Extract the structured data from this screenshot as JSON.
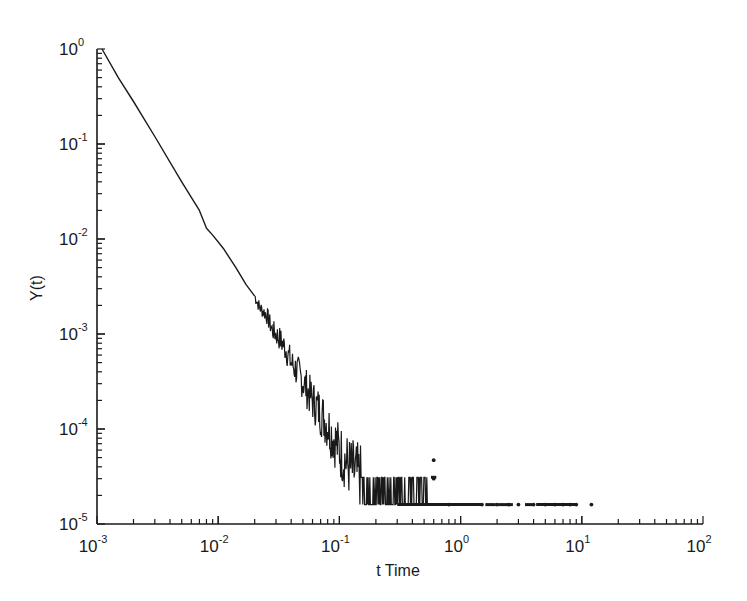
{
  "chart_data": {
    "type": "line",
    "title": "",
    "xlabel": "t Time",
    "ylabel": "Y(t)",
    "xscale": "log",
    "yscale": "log",
    "xlim": [
      0.001,
      100
    ],
    "ylim": [
      1e-05,
      1
    ],
    "grid": false,
    "legend": null,
    "x_tick_labels": [
      {
        "base": "10",
        "exp": "-3",
        "value": 0.001
      },
      {
        "base": "10",
        "exp": "-2",
        "value": 0.01
      },
      {
        "base": "10",
        "exp": "-1",
        "value": 0.1
      },
      {
        "base": "10",
        "exp": "0",
        "value": 1
      },
      {
        "base": "10",
        "exp": "1",
        "value": 10
      },
      {
        "base": "10",
        "exp": "2",
        "value": 100
      }
    ],
    "y_tick_labels": [
      {
        "base": "10",
        "exp": "0",
        "value": 1
      },
      {
        "base": "10",
        "exp": "-1",
        "value": 0.1
      },
      {
        "base": "10",
        "exp": "-2",
        "value": 0.01
      },
      {
        "base": "10",
        "exp": "-3",
        "value": 0.001
      },
      {
        "base": "10",
        "exp": "-4",
        "value": 0.0001
      },
      {
        "base": "10",
        "exp": "-5",
        "value": 1e-05
      }
    ],
    "series": [
      {
        "name": "Y(t)",
        "style": "line",
        "description": "Power-law decay from ~1 at t=1.1e-3, roughly straight on log-log, becoming noisy after t~0.02 and saturating at a floor of ~1.6e-5 for t > ~0.3",
        "points": [
          [
            0.0011,
            1.0
          ],
          [
            0.0015,
            0.5
          ],
          [
            0.002,
            0.28
          ],
          [
            0.003,
            0.12
          ],
          [
            0.005,
            0.04
          ],
          [
            0.007,
            0.02
          ],
          [
            0.008,
            0.013
          ],
          [
            0.009,
            0.011
          ],
          [
            0.011,
            0.008
          ],
          [
            0.014,
            0.005
          ],
          [
            0.017,
            0.0033
          ],
          [
            0.02,
            0.0025
          ],
          [
            0.022,
            0.0019
          ],
          [
            0.025,
            0.0016
          ],
          [
            0.028,
            0.0011
          ],
          [
            0.032,
            0.0009
          ],
          [
            0.036,
            0.0007
          ],
          [
            0.04,
            0.0005
          ],
          [
            0.045,
            0.0004
          ],
          [
            0.05,
            0.00032
          ],
          [
            0.055,
            0.00025
          ],
          [
            0.06,
            0.0002
          ],
          [
            0.07,
            0.00015
          ],
          [
            0.08,
            0.00011
          ],
          [
            0.09,
            8e-05
          ],
          [
            0.1,
            6e-05
          ],
          [
            0.12,
            4e-05
          ],
          [
            0.15,
            3e-05
          ],
          [
            0.2,
            2e-05
          ],
          [
            0.3,
            1.6e-05
          ],
          [
            1.0,
            1.6e-05
          ],
          [
            2.0,
            1.6e-05
          ]
        ]
      },
      {
        "name": "Y(t) scattered tail",
        "style": "points",
        "floor_value": 1.6e-05,
        "secondary_level": 3.1e-05,
        "points": [
          [
            0.6,
            4.7e-05
          ],
          [
            0.6,
            3e-05
          ],
          [
            0.8,
            1.6e-05
          ],
          [
            1.5,
            1.6e-05
          ],
          [
            2.0,
            1.6e-05
          ],
          [
            2.5,
            1.6e-05
          ],
          [
            3.0,
            1.6e-05
          ],
          [
            4.0,
            1.6e-05
          ],
          [
            5.0,
            1.6e-05
          ],
          [
            6.0,
            1.6e-05
          ],
          [
            7.0,
            1.6e-05
          ],
          [
            8.0,
            1.6e-05
          ],
          [
            9.0,
            1.6e-05
          ],
          [
            12.0,
            1.6e-05
          ]
        ]
      }
    ]
  },
  "colors": {
    "line": "#1a1a1a",
    "axis": "#1a1a1a",
    "background": "#ffffff"
  }
}
